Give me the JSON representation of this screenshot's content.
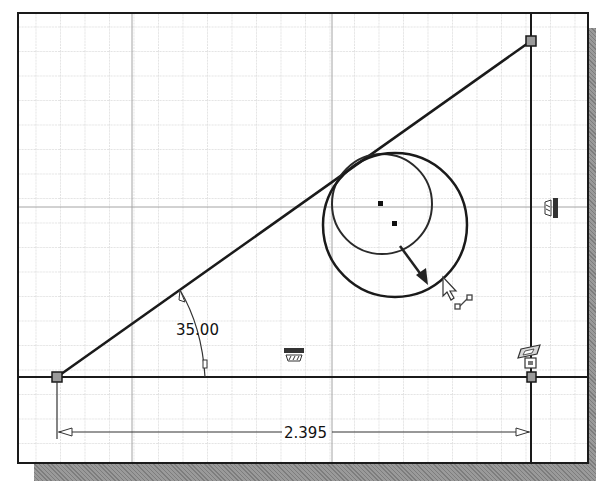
{
  "sketch": {
    "title": "2D Sketch - Triangle with Tangent Circle",
    "grid": {
      "spacing_px": 24.5
    },
    "dimensions": {
      "angle": {
        "value": "35.00",
        "label": "angle-dimension"
      },
      "horizontal": {
        "value": "2.395",
        "label": "horizontal-length-dimension"
      }
    },
    "constraints": {
      "vertical": "vertical-constraint",
      "horizontal": "horizontal-constraint",
      "perpendicular": "perpendicular-constraint",
      "fix": "fix-constraint"
    },
    "cursor": {
      "mode": "resize"
    },
    "colors": {
      "geometry": "#1a1a1a",
      "grid_minor": "#c8c8c8",
      "grid_major": "#9a9a9a",
      "shadow": "#8a8a8a",
      "background": "#ffffff"
    }
  }
}
